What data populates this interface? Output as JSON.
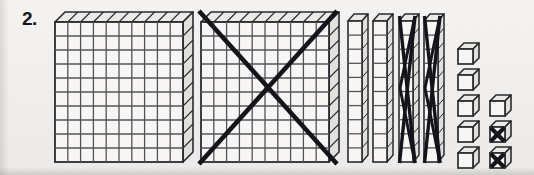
{
  "problem": {
    "number_label": "2.",
    "kind": "base-ten-blocks-subtraction",
    "total_value": 248,
    "crossed_out_value": 122,
    "remaining_value": 126
  },
  "colors": {
    "background": "#f2f1ef",
    "ink": "#2b2a2e",
    "grid_line": "#55535a",
    "crossout": "#15141a",
    "face_fill": "#f7f6f4",
    "top_fill": "#eceae6",
    "side_fill": "#e2e0dc"
  },
  "manipulatives": {
    "flats": {
      "label": "hundreds-flat",
      "unit_value": 100,
      "grid_rows": 10,
      "grid_cols": 10,
      "count": 2,
      "items": [
        {
          "name": "hundreds-flat-1",
          "value": 100,
          "crossed_out": false
        },
        {
          "name": "hundreds-flat-2",
          "value": 100,
          "crossed_out": true
        }
      ]
    },
    "rods": {
      "label": "tens-rod",
      "unit_value": 10,
      "segments": 10,
      "count": 4,
      "items": [
        {
          "name": "tens-rod-1",
          "value": 10,
          "crossed_out": false
        },
        {
          "name": "tens-rod-2",
          "value": 10,
          "crossed_out": false
        },
        {
          "name": "tens-rod-3",
          "value": 10,
          "crossed_out": true
        },
        {
          "name": "tens-rod-4",
          "value": 10,
          "crossed_out": true
        }
      ]
    },
    "units": {
      "label": "ones-cube",
      "unit_value": 1,
      "count": 8,
      "items": [
        {
          "name": "ones-cube-1",
          "value": 1,
          "column": 1,
          "row": 1,
          "crossed_out": false
        },
        {
          "name": "ones-cube-2",
          "value": 1,
          "column": 1,
          "row": 2,
          "crossed_out": false
        },
        {
          "name": "ones-cube-3",
          "value": 1,
          "column": 1,
          "row": 3,
          "crossed_out": false
        },
        {
          "name": "ones-cube-4",
          "value": 1,
          "column": 1,
          "row": 4,
          "crossed_out": false
        },
        {
          "name": "ones-cube-5",
          "value": 1,
          "column": 1,
          "row": 5,
          "crossed_out": false
        },
        {
          "name": "ones-cube-6",
          "value": 1,
          "column": 2,
          "row": 3,
          "crossed_out": false
        },
        {
          "name": "ones-cube-7",
          "value": 1,
          "column": 2,
          "row": 4,
          "crossed_out": true
        },
        {
          "name": "ones-cube-8",
          "value": 1,
          "column": 2,
          "row": 5,
          "crossed_out": true
        }
      ]
    }
  }
}
